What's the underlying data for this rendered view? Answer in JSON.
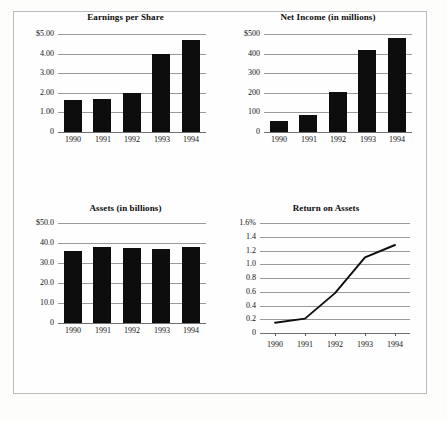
{
  "document": {
    "kind": "financial-highlights-figure",
    "background_color": "#fdfdfc",
    "frame_color": "#b9b9b9",
    "ink_color": "#0d0d0d",
    "gridline_color": "#9a9a9a"
  },
  "charts": {
    "eps": {
      "title": "Earnings per Share",
      "type": "bar",
      "categories": [
        "1990",
        "1991",
        "1992",
        "1993",
        "1994"
      ],
      "values": [
        1.62,
        1.7,
        1.98,
        3.98,
        4.68
      ],
      "ytick_labels": [
        "$5.00",
        "4.00",
        "3.00",
        "2.00",
        "1.00",
        "0"
      ],
      "ytick_values": [
        5.0,
        4.0,
        3.0,
        2.0,
        1.0,
        0
      ],
      "ylim": [
        0,
        5.0
      ],
      "xlabel": "",
      "ylabel": "",
      "grid": true
    },
    "net_income": {
      "title": "Net Income (in millions)",
      "type": "bar",
      "categories": [
        "1990",
        "1991",
        "1992",
        "1993",
        "1994"
      ],
      "values": [
        55,
        85,
        205,
        420,
        480
      ],
      "ytick_labels": [
        "$500",
        "400",
        "300",
        "200",
        "100",
        "0"
      ],
      "ytick_values": [
        500,
        400,
        300,
        200,
        100,
        0
      ],
      "ylim": [
        0,
        500
      ],
      "xlabel": "",
      "ylabel": "",
      "grid": true
    },
    "assets": {
      "title": "Assets (in billions)",
      "type": "bar",
      "categories": [
        "1990",
        "1991",
        "1992",
        "1993",
        "1994"
      ],
      "values": [
        36.2,
        37.8,
        37.5,
        37.2,
        38.0
      ],
      "ytick_labels": [
        "$50.0",
        "40.0",
        "30.0",
        "20.0",
        "10.0",
        "0"
      ],
      "ytick_values": [
        50.0,
        40.0,
        30.0,
        20.0,
        10.0,
        0
      ],
      "ylim": [
        0,
        50.0
      ],
      "xlabel": "",
      "ylabel": "",
      "grid": true
    },
    "return_on_assets": {
      "title": "Return on Assets",
      "type": "line",
      "categories": [
        "1990",
        "1991",
        "1992",
        "1993",
        "1994"
      ],
      "values": [
        0.15,
        0.21,
        0.58,
        1.1,
        1.28
      ],
      "ytick_labels": [
        "1.6%",
        "1.4",
        "1.2",
        "1.0",
        "0.8",
        "0.6",
        "0.4",
        "0.2",
        "0"
      ],
      "ytick_values": [
        1.6,
        1.4,
        1.2,
        1.0,
        0.8,
        0.6,
        0.4,
        0.2,
        0
      ],
      "ylim": [
        0,
        1.6
      ],
      "xlabel": "",
      "ylabel": "",
      "grid": true
    }
  },
  "chart_data": [
    {
      "type": "bar",
      "title": "Earnings per Share",
      "categories": [
        "1990",
        "1991",
        "1992",
        "1993",
        "1994"
      ],
      "values": [
        1.62,
        1.7,
        1.98,
        3.98,
        4.68
      ],
      "xlabel": "",
      "ylabel": "",
      "ylim": [
        0,
        5.0
      ],
      "ytick_labels": [
        "$5.00",
        "4.00",
        "3.00",
        "2.00",
        "1.00",
        "0"
      ],
      "grid": true,
      "legend": null
    },
    {
      "type": "bar",
      "title": "Net Income (in millions)",
      "categories": [
        "1990",
        "1991",
        "1992",
        "1993",
        "1994"
      ],
      "values": [
        55,
        85,
        205,
        420,
        480
      ],
      "xlabel": "",
      "ylabel": "",
      "ylim": [
        0,
        500
      ],
      "ytick_labels": [
        "$500",
        "400",
        "300",
        "200",
        "100",
        "0"
      ],
      "grid": true,
      "legend": null
    },
    {
      "type": "bar",
      "title": "Assets (in billions)",
      "categories": [
        "1990",
        "1991",
        "1992",
        "1993",
        "1994"
      ],
      "values": [
        36.2,
        37.8,
        37.5,
        37.2,
        38.0
      ],
      "xlabel": "",
      "ylabel": "",
      "ylim": [
        0,
        50.0
      ],
      "ytick_labels": [
        "$50.0",
        "40.0",
        "30.0",
        "20.0",
        "10.0",
        "0"
      ],
      "grid": true,
      "legend": null
    },
    {
      "type": "line",
      "title": "Return on Assets",
      "categories": [
        "1990",
        "1991",
        "1992",
        "1993",
        "1994"
      ],
      "values": [
        0.15,
        0.21,
        0.58,
        1.1,
        1.28
      ],
      "xlabel": "",
      "ylabel": "",
      "ylim": [
        0,
        1.6
      ],
      "ytick_labels": [
        "1.6%",
        "1.4",
        "1.2",
        "1.0",
        "0.8",
        "0.6",
        "0.4",
        "0.2",
        "0"
      ],
      "grid": true,
      "legend": null
    }
  ]
}
